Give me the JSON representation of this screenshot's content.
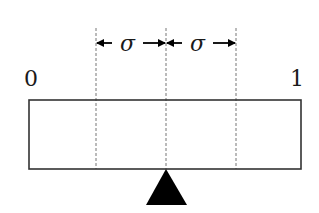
{
  "diagram": {
    "type": "balance-beam",
    "scale_labels": {
      "left": "0",
      "right": "1"
    },
    "interval_labels": [
      "σ",
      "σ"
    ],
    "colors": {
      "stroke": "#333333",
      "dashed": "#777777",
      "fulcrum": "#000000",
      "background": "#ffffff"
    },
    "geometry": {
      "beam": {
        "x": 29,
        "y": 100,
        "width": 272,
        "height": 69
      },
      "dashed_lines_x": [
        96,
        166,
        236
      ],
      "fulcrum_apex": [
        166,
        169
      ],
      "arrow_y": 43
    }
  }
}
